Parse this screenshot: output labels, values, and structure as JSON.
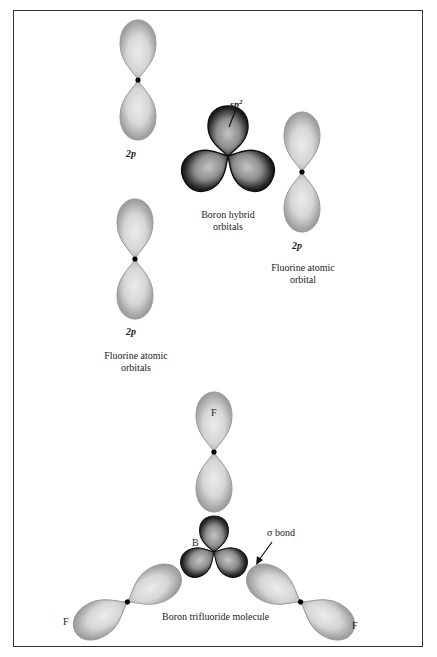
{
  "diagram": {
    "colors": {
      "p_orbital_fill": "#a9a9a9",
      "p_orbital_center": "#e6e6e6",
      "hybrid_orbital_edge": "#111111",
      "hybrid_orbital_center": "#b5b5b5",
      "nucleus": "#000000",
      "border": "#333333"
    },
    "labels": {
      "f_orbital_top_left": "2p",
      "sp2": "sp",
      "sp2_superscript": "2",
      "boron_hybrid_line1": "Boron hybrid",
      "boron_hybrid_line2": "orbitals",
      "f_orbital_right": "2p",
      "fluorine_atomic_orbital_line1": "Fluorine atomic",
      "fluorine_atomic_orbital_line2": "orbital",
      "f_orbital_left_middle": "2p",
      "fluorine_atomic_orbitals_line1": "Fluorine atomic",
      "fluorine_atomic_orbitals_line2": "orbitals",
      "atom_f_top": "F",
      "atom_b": "B",
      "sigma_bond": "σ bond",
      "atom_f_left": "F",
      "atom_f_right": "F",
      "molecule_caption": "Boron trifluoride molecule"
    }
  }
}
